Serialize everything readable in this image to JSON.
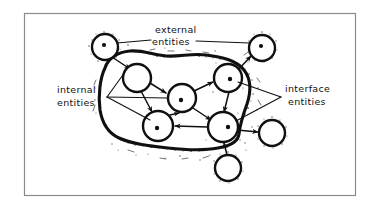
{
  "figure": {
    "kind": "hand-drawn-diagram",
    "title_present": false,
    "background_color": "#ffffff",
    "ink_color": "#101010",
    "frame": {
      "name": "figure-border",
      "color": "#8a8a8a",
      "x": 24,
      "y": 13,
      "width": 332,
      "height": 183
    }
  },
  "labels": {
    "external": {
      "line1": "external",
      "line2": "entities"
    },
    "internal": {
      "line1": "internal",
      "line2": "entities"
    },
    "interface": {
      "line1": "interface",
      "line2": "entities"
    }
  },
  "diagram_data": {
    "type": "node-link-diagram",
    "boundary": {
      "name": "system-boundary-blob",
      "style": "thick irregular closed curve with speckled halo",
      "stroke_width": 3
    },
    "nodes": [
      {
        "id": "ext-top-left",
        "group": "external",
        "cx": 105,
        "cy": 47,
        "r": 13,
        "dot": true
      },
      {
        "id": "ext-top-right",
        "group": "external",
        "cx": 262,
        "cy": 48,
        "r": 13,
        "dot": true
      },
      {
        "id": "ext-bottom",
        "group": "external",
        "cx": 228,
        "cy": 168,
        "r": 13,
        "dot": false
      },
      {
        "id": "ext-right",
        "group": "external",
        "cx": 272,
        "cy": 133,
        "r": 13,
        "dot": false
      },
      {
        "id": "int-upper-left",
        "group": "internal",
        "cx": 137,
        "cy": 78,
        "r": 14,
        "dot": false
      },
      {
        "id": "int-center",
        "group": "internal",
        "cx": 182,
        "cy": 98,
        "r": 14,
        "dot": true
      },
      {
        "id": "int-lower-left",
        "group": "internal",
        "cx": 158,
        "cy": 126,
        "r": 15,
        "dot": true
      },
      {
        "id": "iface-upper",
        "group": "interface",
        "cx": 228,
        "cy": 78,
        "r": 14,
        "dot": true
      },
      {
        "id": "iface-lower",
        "group": "interface",
        "cx": 223,
        "cy": 127,
        "r": 15,
        "dot": true
      }
    ],
    "edges": [
      {
        "from": "ext-top-left",
        "to": "int-upper-left",
        "arrow": true
      },
      {
        "from": "int-upper-left",
        "to": "int-center",
        "arrow": true
      },
      {
        "from": "int-upper-left",
        "to": "int-lower-left",
        "arrow": true
      },
      {
        "from": "int-center",
        "to": "iface-upper",
        "arrow": true
      },
      {
        "from": "int-center",
        "to": "iface-lower",
        "arrow": true
      },
      {
        "from": "iface-upper",
        "to": "iface-lower",
        "arrow": true
      },
      {
        "from": "iface-lower",
        "to": "int-lower-left",
        "arrow": true
      },
      {
        "from": "int-lower-left",
        "to": "int-center",
        "arrow": true
      },
      {
        "from": "iface-upper",
        "to": "ext-top-right",
        "arrow": true
      },
      {
        "from": "iface-lower",
        "to": "ext-right",
        "arrow": true
      },
      {
        "from": "ext-bottom",
        "to": "iface-lower",
        "arrow": true
      }
    ],
    "annotations": [
      {
        "label": "external",
        "targets": [
          "ext-top-left",
          "ext-top-right"
        ],
        "leader": "two lines"
      },
      {
        "label": "internal",
        "targets": [
          "int-upper-left",
          "int-center",
          "int-lower-left"
        ],
        "leader": "fan of three lines"
      },
      {
        "label": "interface",
        "targets": [
          "iface-upper",
          "iface-lower"
        ],
        "leader": "fan of two lines"
      }
    ]
  }
}
